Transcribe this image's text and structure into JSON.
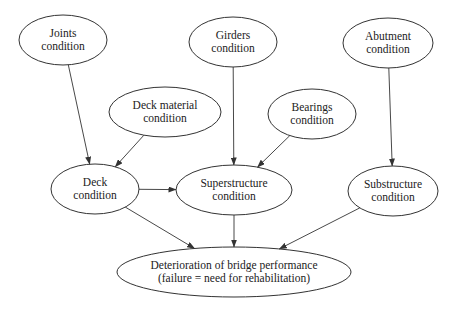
{
  "diagram": {
    "type": "directed-graph",
    "nodes": [
      {
        "id": "joints",
        "line1": "Joints",
        "line2": "condition",
        "cx": 63,
        "cy": 40,
        "rx": 44,
        "ry": 25
      },
      {
        "id": "girders",
        "line1": "Girders",
        "line2": "condition",
        "cx": 233,
        "cy": 42,
        "rx": 44,
        "ry": 25
      },
      {
        "id": "abutment",
        "line1": "Abutment",
        "line2": "condition",
        "cx": 388,
        "cy": 43,
        "rx": 45,
        "ry": 25
      },
      {
        "id": "deck_material",
        "line1": "Deck material",
        "line2": "condition",
        "cx": 165,
        "cy": 112,
        "rx": 56,
        "ry": 25
      },
      {
        "id": "bearings",
        "line1": "Bearings",
        "line2": "condition",
        "cx": 312,
        "cy": 114,
        "rx": 44,
        "ry": 25
      },
      {
        "id": "deck",
        "line1": "Deck",
        "line2": "condition",
        "cx": 95,
        "cy": 189,
        "rx": 44,
        "ry": 25
      },
      {
        "id": "superstructure",
        "line1": "Superstructure",
        "line2": "condition",
        "cx": 234,
        "cy": 190,
        "rx": 58,
        "ry": 25
      },
      {
        "id": "substructure",
        "line1": "Substructure",
        "line2": "condition",
        "cx": 393,
        "cy": 191,
        "rx": 45,
        "ry": 25
      },
      {
        "id": "deterioration",
        "line1": "Deterioration of bridge performance",
        "line2": "(failure = need for rehabilitation)",
        "cx": 234,
        "cy": 272,
        "rx": 117,
        "ry": 25
      }
    ],
    "edges": [
      {
        "from": "joints",
        "to": "deck"
      },
      {
        "from": "deck_material",
        "to": "deck"
      },
      {
        "from": "girders",
        "to": "superstructure"
      },
      {
        "from": "bearings",
        "to": "superstructure"
      },
      {
        "from": "deck",
        "to": "superstructure"
      },
      {
        "from": "abutment",
        "to": "substructure"
      },
      {
        "from": "deck",
        "to": "deterioration"
      },
      {
        "from": "superstructure",
        "to": "deterioration"
      },
      {
        "from": "substructure",
        "to": "deterioration"
      }
    ],
    "colors": {
      "stroke": "#333333",
      "text": "#222222",
      "background": "#ffffff"
    }
  }
}
